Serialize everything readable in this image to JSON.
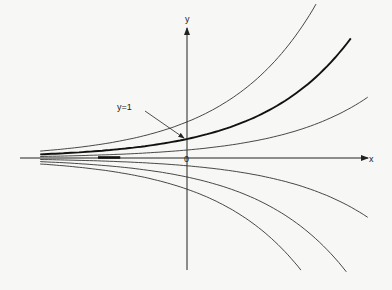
{
  "chart_data": {
    "type": "line",
    "title": "",
    "xlabel": "x",
    "ylabel": "y",
    "origin_label": "0",
    "function": "y = C e^x",
    "xlim": [
      -1.65,
      2.05
    ],
    "ylim": [
      -5.9,
      6.6
    ],
    "grid": false,
    "series": [
      {
        "name": "C=1.9",
        "C": 1.9,
        "x_range": [
          -1.65,
          1.45
        ],
        "highlight": false
      },
      {
        "name": "C=1",
        "C": 1.0,
        "x_range": [
          -1.65,
          1.84
        ],
        "highlight": true
      },
      {
        "name": "C=0.42",
        "C": 0.42,
        "x_range": [
          -1.65,
          2.03
        ],
        "highlight": false
      },
      {
        "name": "C=-0.41",
        "C": -0.41,
        "x_range": [
          -1.65,
          2.03
        ],
        "highlight": false
      },
      {
        "name": "C=-1",
        "C": -1.0,
        "x_range": [
          -1.65,
          1.79
        ],
        "highlight": false
      },
      {
        "name": "C=-1.64",
        "C": -1.64,
        "x_range": [
          -1.65,
          1.28
        ],
        "highlight": false
      }
    ],
    "zero_solution": {
      "name": "C=0",
      "x_range": [
        -1.0,
        -0.75
      ]
    },
    "annotations": [
      {
        "text": "y=1",
        "points_to": {
          "x": 0,
          "y": 1
        }
      }
    ]
  }
}
